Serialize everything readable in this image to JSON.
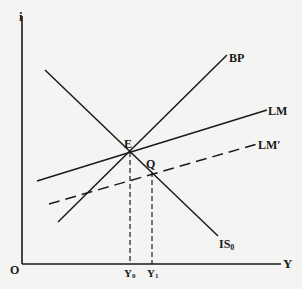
{
  "diagram": {
    "type": "IS-LM-BP",
    "axes": {
      "y_label": "i",
      "x_label": "Y",
      "origin_label": "O"
    },
    "curves": [
      {
        "id": "is",
        "label": "IS",
        "subscript": "0",
        "style": "solid"
      },
      {
        "id": "bp",
        "label": "BP",
        "style": "solid"
      },
      {
        "id": "lm",
        "label": "LM",
        "style": "solid"
      },
      {
        "id": "lm_prime",
        "label": "LM′",
        "style": "dashed"
      }
    ],
    "points": [
      {
        "id": "E",
        "label": "E"
      },
      {
        "id": "Q",
        "label": "Q"
      }
    ],
    "x_ticks": [
      {
        "label": "Y",
        "subscript": "0"
      },
      {
        "label": "Y",
        "subscript": "1"
      }
    ],
    "colors": {
      "ink": "#1a1a1a",
      "paper": "#f4f4f2"
    }
  }
}
